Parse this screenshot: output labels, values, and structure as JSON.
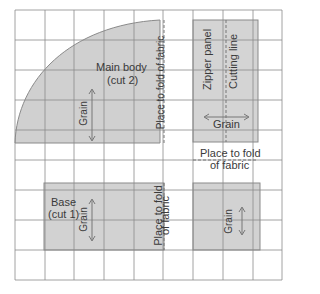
{
  "diagram": {
    "type": "sewing-pattern-layout",
    "grid": {
      "cols": 9,
      "rows": 9,
      "cell_size": 29.7,
      "left": 15,
      "top": 10
    },
    "colors": {
      "grid": "#8c8c8c",
      "piece_fill": "#d2d2d2",
      "piece_fill_dark": "#c4c4c4",
      "outline": "#8a8a8a",
      "text": "#3a3a3a",
      "background": "#ffffff"
    },
    "pieces": {
      "main_body": {
        "title": "Main body",
        "subtitle": "(cut 2)",
        "grain": "Grain",
        "fold": "Place to fold of fabric"
      },
      "zipper_panel": {
        "title": "Zipper panel",
        "cutting": "Cutting line",
        "grain": "Grain",
        "fold_line1": "Place to fold",
        "fold_line2": "of fabric"
      },
      "base": {
        "title": "Base",
        "subtitle": "(cut 1)",
        "grain": "Grain",
        "fold_line1": "Place to fold",
        "fold_line2": "of fabric"
      },
      "small_panel": {
        "grain": "Grain"
      }
    }
  }
}
